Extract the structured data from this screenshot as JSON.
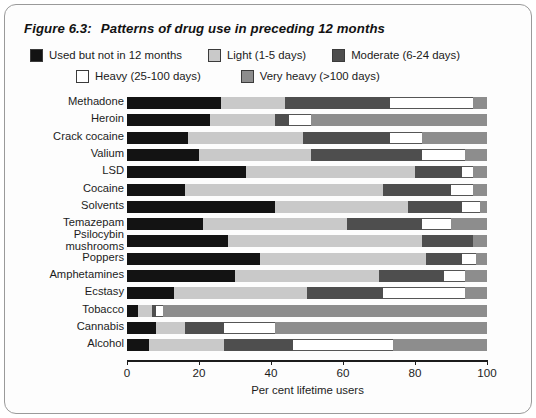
{
  "figure": {
    "number": "Figure 6.3:",
    "title": "Patterns of drug use in preceding 12 months"
  },
  "legend": {
    "items": [
      {
        "label": "Used but not in 12 months",
        "color": "#131313",
        "key": "used"
      },
      {
        "label": "Light (1-5 days)",
        "color": "#c9c9c9",
        "key": "light"
      },
      {
        "label": "Moderate (6-24 days)",
        "color": "#4e4e4e",
        "key": "moderate"
      },
      {
        "label": "Heavy (25-100 days)",
        "color": "#ffffff",
        "key": "heavy"
      },
      {
        "label": "Very heavy (>100 days)",
        "color": "#8d8d8d",
        "key": "very_heavy"
      }
    ]
  },
  "axis": {
    "x_title": "Per cent lifetime users",
    "x_ticks": [
      "0",
      "20",
      "40",
      "60",
      "80",
      "100"
    ],
    "x_min": 0,
    "x_max": 100
  },
  "chart_data": {
    "type": "bar",
    "orientation": "horizontal",
    "stacked": true,
    "title": "Patterns of drug use in preceding 12 months",
    "xlabel": "Per cent lifetime users",
    "ylabel": "",
    "xlim": [
      0,
      100
    ],
    "grid": false,
    "legend_position": "top",
    "categories": [
      "Methadone",
      "Heroin",
      "Crack cocaine",
      "Valium",
      "LSD",
      "Cocaine",
      "Solvents",
      "Temazepam",
      "Psilocybin mushrooms",
      "Poppers",
      "Amphetamines",
      "Ecstasy",
      "Tobacco",
      "Cannabis",
      "Alcohol"
    ],
    "series": [
      {
        "name": "Used but not in 12 months",
        "color": "#131313",
        "values": [
          26,
          23,
          17,
          20,
          33,
          16,
          41,
          21,
          28,
          37,
          30,
          13,
          3,
          8,
          6
        ]
      },
      {
        "name": "Light (1-5 days)",
        "color": "#c9c9c9",
        "values": [
          18,
          18,
          32,
          31,
          47,
          55,
          37,
          40,
          54,
          46,
          40,
          37,
          4,
          8,
          21
        ]
      },
      {
        "name": "Moderate (6-24 days)",
        "color": "#4e4e4e",
        "values": [
          29,
          4,
          24,
          31,
          13,
          19,
          15,
          21,
          14,
          10,
          18,
          21,
          1,
          11,
          19
        ]
      },
      {
        "name": "Heavy (25-100 days)",
        "color": "#ffffff",
        "values": [
          23,
          6,
          9,
          12,
          3,
          6,
          5,
          8,
          0,
          4,
          6,
          23,
          2,
          14,
          28
        ]
      },
      {
        "name": "Very heavy (>100 days)",
        "color": "#8d8d8d",
        "values": [
          4,
          49,
          18,
          6,
          4,
          4,
          2,
          10,
          4,
          3,
          6,
          6,
          90,
          59,
          26
        ]
      }
    ]
  }
}
